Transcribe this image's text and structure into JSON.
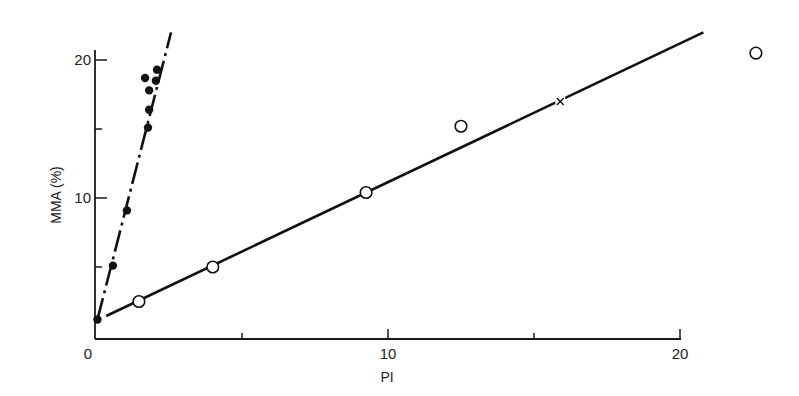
{
  "chart_data": {
    "type": "scatter",
    "title": "",
    "xlabel": "PI",
    "ylabel": "MMA (%)",
    "xlim": [
      0,
      20
    ],
    "ylim": [
      0,
      20
    ],
    "xticks": [
      0,
      5,
      10,
      15,
      20
    ],
    "xtick_labels": [
      "0",
      "",
      "10",
      "",
      "20"
    ],
    "yticks": [
      5,
      10,
      15,
      20
    ],
    "ytick_labels": [
      "",
      "10",
      "",
      "20"
    ],
    "grid": false,
    "legend": null,
    "series": [
      {
        "name": "filled-circles",
        "marker": "filled-circle",
        "points": [
          {
            "x": 0.05,
            "y": 1.2
          },
          {
            "x": 0.58,
            "y": 5.1
          },
          {
            "x": 1.06,
            "y": 9.1
          },
          {
            "x": 1.78,
            "y": 15.1
          },
          {
            "x": 1.82,
            "y": 16.4
          },
          {
            "x": 1.82,
            "y": 17.8
          },
          {
            "x": 1.68,
            "y": 18.7
          },
          {
            "x": 2.05,
            "y": 18.5
          },
          {
            "x": 2.09,
            "y": 19.3
          }
        ],
        "fit_line": {
          "style": "dash-dot",
          "from": {
            "x": 0.05,
            "y": 1.2
          },
          "to": {
            "x": 2.57,
            "y": 22.0
          }
        }
      },
      {
        "name": "open-circles",
        "marker": "open-circle",
        "points": [
          {
            "x": 1.47,
            "y": 2.5
          },
          {
            "x": 4.0,
            "y": 5.0
          },
          {
            "x": 9.25,
            "y": 10.4
          },
          {
            "x": 12.5,
            "y": 15.2
          },
          {
            "x": 22.6,
            "y": 20.5
          }
        ],
        "fit_line": {
          "style": "solid",
          "from": {
            "x": 0.35,
            "y": 1.45
          },
          "to": {
            "x": 20.8,
            "y": 22.0
          }
        }
      },
      {
        "name": "cross",
        "marker": "x",
        "points": [
          {
            "x": 15.9,
            "y": 17.0
          }
        ]
      }
    ]
  }
}
